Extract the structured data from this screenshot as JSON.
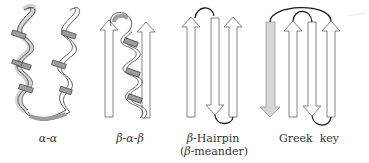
{
  "motifs": [
    {
      "id": "alpha-alpha",
      "label": "α-α"
    },
    {
      "id": "beta-alpha-beta",
      "label": "β-α-β"
    },
    {
      "id": "beta-hairpin",
      "label_line1_prefix": "β",
      "label_line1_suffix": "-Hairpin",
      "label_line2_open": "(",
      "label_line2_prefix": "β",
      "label_line2_suffix": "-meander)"
    },
    {
      "id": "greek-key",
      "label": "Greek  key"
    }
  ],
  "colors": {
    "ribbon_fill": "#ffffff",
    "ribbon_back": "#9e9e9e",
    "outline": "#555555",
    "loop": "#1a1a1a",
    "shaded_strand": "#d6d6d6"
  }
}
